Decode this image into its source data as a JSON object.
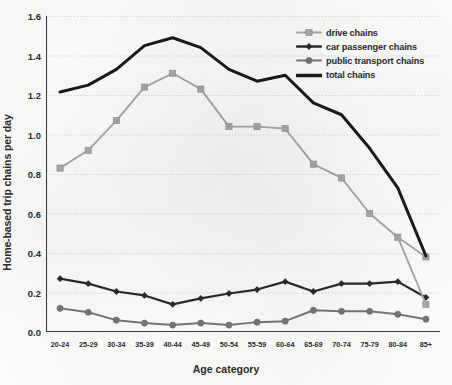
{
  "chart_data": {
    "type": "line",
    "title": "",
    "xlabel": "Age category",
    "ylabel": "Home-based trip chains per day",
    "categories": [
      "20-24",
      "25-29",
      "30-34",
      "35-39",
      "40-44",
      "45-49",
      "50-54",
      "55-59",
      "60-64",
      "65-69",
      "70-74",
      "75-79",
      "80-84",
      "85+"
    ],
    "ylim": [
      0.0,
      1.6
    ],
    "ytick_labels": [
      "0.0",
      "0.2",
      "0.4",
      "0.6",
      "0.8",
      "1.0",
      "1.2",
      "1.4",
      "1.6"
    ],
    "ytick_values": [
      0.0,
      0.2,
      0.4,
      0.6,
      0.8,
      1.0,
      1.2,
      1.4,
      1.6
    ],
    "grid": "horizontal",
    "legend_position": "top-right",
    "series": [
      {
        "name": "drive chains",
        "color": "#a8a8a8",
        "marker": "square",
        "values": [
          0.83,
          0.92,
          1.07,
          1.24,
          1.31,
          1.23,
          1.04,
          1.04,
          1.03,
          0.85,
          0.78,
          0.6,
          0.48,
          0.38
        ]
      },
      {
        "name": "car passenger chains",
        "color": "#2a2a2a",
        "marker": "diamond",
        "values": [
          0.27,
          0.245,
          0.205,
          0.185,
          0.14,
          0.17,
          0.195,
          0.215,
          0.255,
          0.205,
          0.245,
          0.245,
          0.255,
          0.175
        ]
      },
      {
        "name": "public transport chains",
        "color": "#767676",
        "marker": "circle",
        "values": [
          0.12,
          0.1,
          0.06,
          0.045,
          0.035,
          0.045,
          0.035,
          0.05,
          0.055,
          0.11,
          0.105,
          0.105,
          0.09,
          0.065
        ]
      },
      {
        "name": "total chains",
        "color": "#1a1a1a",
        "marker": "none",
        "values": [
          1.215,
          1.25,
          1.33,
          1.45,
          1.49,
          1.44,
          1.33,
          1.27,
          1.3,
          1.16,
          1.1,
          0.93,
          0.73,
          0.385
        ]
      }
    ],
    "extra_series": [
      {
        "name": "drive chains tail",
        "note": "drive chains descends to 0.14 at 85+",
        "values": [
          0.38,
          0.14
        ]
      }
    ]
  },
  "legend": {
    "items": [
      {
        "label": "drive chains",
        "icon": "line-square-marker-icon"
      },
      {
        "label": "car passenger chains",
        "icon": "line-diamond-marker-icon"
      },
      {
        "label": "public transport chains",
        "icon": "line-circle-marker-icon"
      },
      {
        "label": "total chains",
        "icon": "thick-line-icon"
      }
    ]
  },
  "axes": {
    "y_axis_title": "Home-based trip chains per day",
    "x_axis_title": "Age category"
  }
}
